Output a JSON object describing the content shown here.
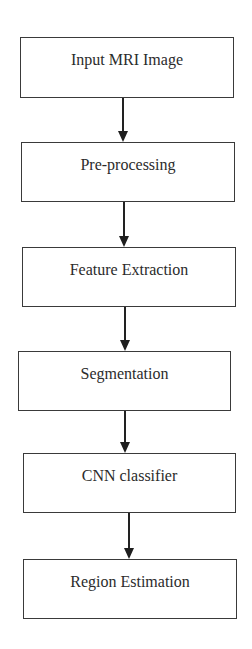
{
  "diagram": {
    "type": "flowchart",
    "direction": "top-to-bottom",
    "nodes": [
      {
        "id": "n1",
        "label": "Input MRI Image",
        "x": 20,
        "y": 37,
        "w": 214,
        "h": 61
      },
      {
        "id": "n2",
        "label": "Pre-processing",
        "x": 21,
        "y": 142,
        "w": 214,
        "h": 60
      },
      {
        "id": "n3",
        "label": "Feature Extraction",
        "x": 22,
        "y": 247,
        "w": 214,
        "h": 60
      },
      {
        "id": "n4",
        "label": "Segmentation",
        "x": 18,
        "y": 351,
        "w": 213,
        "h": 60
      },
      {
        "id": "n5",
        "label": "CNN classifier",
        "x": 23,
        "y": 453,
        "w": 213,
        "h": 60
      },
      {
        "id": "n6",
        "label": "Region Estimation",
        "x": 23,
        "y": 559,
        "w": 214,
        "h": 60
      }
    ],
    "edges": [
      {
        "from": "n1",
        "to": "n2",
        "x": 123,
        "y1": 98,
        "y2": 142
      },
      {
        "from": "n2",
        "to": "n3",
        "x": 124,
        "y1": 202,
        "y2": 247
      },
      {
        "from": "n3",
        "to": "n4",
        "x": 125,
        "y1": 307,
        "y2": 351
      },
      {
        "from": "n4",
        "to": "n5",
        "x": 125,
        "y1": 411,
        "y2": 453
      },
      {
        "from": "n5",
        "to": "n6",
        "x": 129,
        "y1": 513,
        "y2": 559
      }
    ],
    "colors": {
      "border": "#3a3a3a",
      "text": "#2b2b2b",
      "arrow": "#222222",
      "background": "#ffffff"
    }
  }
}
